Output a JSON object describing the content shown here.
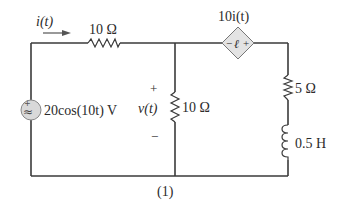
{
  "circuit": {
    "current_label": "i(t)",
    "resistor_top": {
      "label": "10 Ω"
    },
    "dependent_source": {
      "label": "10i(t)",
      "type": "current-controlled voltage source",
      "polarity": "−  +"
    },
    "voltage_source": {
      "label": "20cos(10t) V",
      "symbol": "≈"
    },
    "resistor_middle": {
      "label": "10 Ω"
    },
    "voltage_label": {
      "name": "v(t)",
      "plus": "+",
      "minus": "−"
    },
    "resistor_right": {
      "label": "5 Ω"
    },
    "inductor": {
      "label": "0.5 H"
    },
    "caption": "(1)"
  },
  "colors": {
    "wire": "#3a3a3a",
    "source_fill": "#d9d9d9",
    "text": "#2b2b2b"
  }
}
